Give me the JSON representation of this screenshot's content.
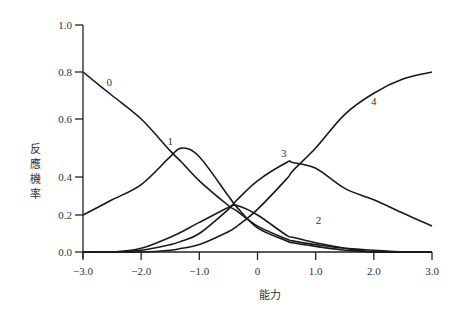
{
  "chart_data": {
    "type": "line",
    "title": "",
    "xlabel": "能力",
    "ylabel": "反應機率",
    "xlim": [
      -3.0,
      3.0
    ],
    "ylim": [
      0.0,
      1.0
    ],
    "grid": false,
    "legend": "inline curve labels",
    "x_ticks": [
      "-3.0",
      "-2.0",
      "-1.0",
      "0",
      "1.0",
      "2.0",
      "3.0"
    ],
    "y_ticks": [
      "0.0",
      "0.2",
      "0.4",
      "0.6",
      "0.8",
      "1.0"
    ],
    "x": [
      -3.0,
      -2.5,
      -2.0,
      -1.5,
      -1.3,
      -1.0,
      -0.5,
      -0.35,
      0.0,
      0.5,
      0.6,
      1.0,
      1.5,
      2.0,
      2.5,
      3.0
    ],
    "series": [
      {
        "name": "0",
        "label_pos": [
          -2.55,
          0.74
        ],
        "values": [
          0.8,
          0.7,
          0.6,
          0.49,
          0.45,
          0.38,
          0.25,
          0.22,
          0.14,
          0.07,
          0.06,
          0.04,
          0.02,
          0.01,
          0.0,
          0.0
        ]
      },
      {
        "name": "1",
        "label_pos": [
          -1.5,
          0.51
        ],
        "values": [
          0.2,
          0.28,
          0.36,
          0.47,
          0.5,
          0.47,
          0.3,
          0.24,
          0.13,
          0.06,
          0.05,
          0.03,
          0.01,
          0.0,
          0.0,
          0.0
        ]
      },
      {
        "name": "2",
        "label_pos": [
          1.05,
          0.15
        ],
        "values": [
          0.0,
          0.0,
          0.02,
          0.08,
          0.11,
          0.16,
          0.24,
          0.25,
          0.2,
          0.09,
          0.08,
          0.05,
          0.02,
          0.0,
          0.0,
          0.0
        ]
      },
      {
        "name": "3",
        "label_pos": [
          0.45,
          0.47
        ],
        "values": [
          0.0,
          0.0,
          0.01,
          0.04,
          0.06,
          0.1,
          0.23,
          0.28,
          0.38,
          0.45,
          0.45,
          0.43,
          0.34,
          0.28,
          0.21,
          0.14
        ]
      },
      {
        "name": "4",
        "label_pos": [
          2.0,
          0.66
        ],
        "values": [
          0.0,
          0.0,
          0.0,
          0.01,
          0.02,
          0.04,
          0.11,
          0.14,
          0.23,
          0.39,
          0.42,
          0.5,
          0.62,
          0.71,
          0.77,
          0.8
        ]
      }
    ]
  },
  "axes": {
    "xlabel": "能力",
    "ylabel_chars": [
      "反",
      "應",
      "機",
      "率"
    ]
  }
}
